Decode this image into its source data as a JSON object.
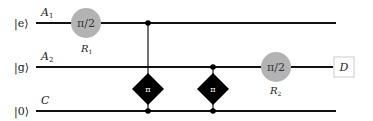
{
  "diagram": {
    "type": "quantum-circuit",
    "wires": [
      {
        "state": "|e⟩",
        "label": "A",
        "sub": "1"
      },
      {
        "state": "|g⟩",
        "label": "A",
        "sub": "2"
      },
      {
        "state": "|0⟩",
        "label": "C",
        "sub": ""
      }
    ],
    "gates": [
      {
        "kind": "rotation",
        "text": "π/2",
        "name": "R",
        "sub": "1",
        "wire": 0
      },
      {
        "kind": "controlled-phase",
        "text": "π",
        "control_wire": 0,
        "targets": [
          2
        ]
      },
      {
        "kind": "controlled-phase",
        "text": "π",
        "control_wire": 1,
        "targets": [
          2
        ]
      },
      {
        "kind": "rotation",
        "text": "π/2",
        "name": "R",
        "sub": "2",
        "wire": 1
      }
    ],
    "detector": {
      "text": "D",
      "wire": 1
    },
    "colors": {
      "wire": "#111111",
      "rotation_fill": "#b3b3b3",
      "phase_fill": "#000000",
      "detector_border": "#cccccc"
    }
  }
}
